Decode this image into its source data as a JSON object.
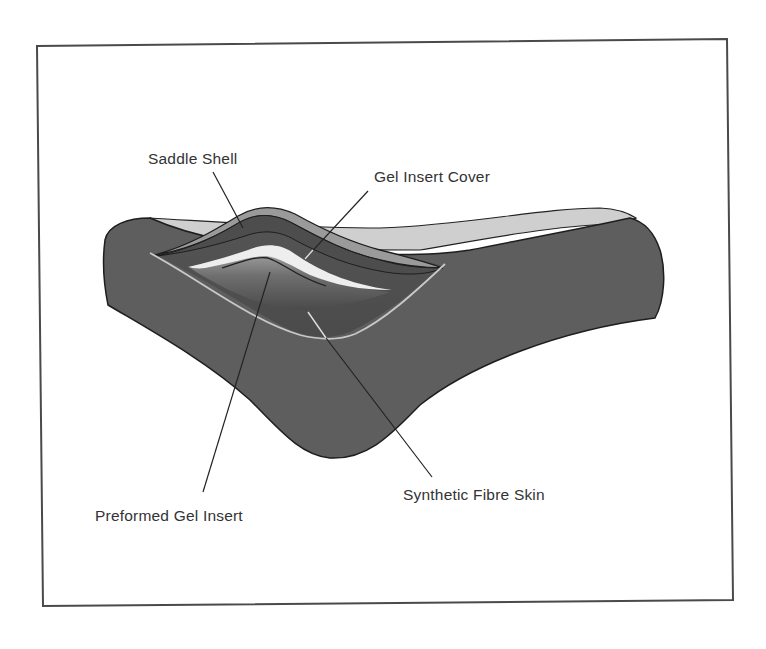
{
  "diagram": {
    "labels": {
      "saddle_shell": "Saddle Shell",
      "gel_insert_cover": "Gel Insert Cover",
      "preformed_gel_insert": "Preformed Gel Insert",
      "synthetic_fibre_skin": "Synthetic Fibre Skin"
    },
    "colors": {
      "background": "#ffffff",
      "frame": "#4a4a4a",
      "saddle_body": "#5e5e5e",
      "top_surface": "#cfcfcf",
      "shell_band": "#9a9a9a",
      "cover_band": "#4d4d4d",
      "gel_highlight": "#eeeeee",
      "skin_line": "#c8c8c8",
      "leader_line": "#222222",
      "text": "#333333"
    }
  }
}
